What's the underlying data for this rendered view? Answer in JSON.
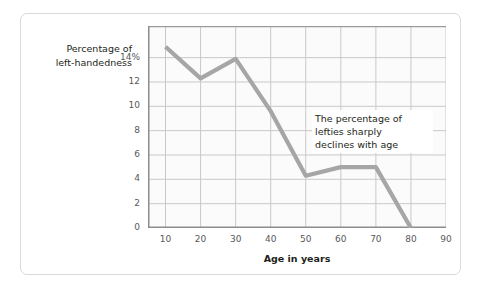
{
  "chart_data": {
    "type": "line",
    "title": "",
    "subtitle": "",
    "xlabel": "Age in years",
    "ylabel": "Percentage of\nleft-handedness",
    "x": [
      10,
      20,
      30,
      40,
      50,
      60,
      70,
      80
    ],
    "values": [
      14.9,
      12.3,
      13.9,
      9.6,
      4.3,
      5.0,
      5.0,
      0.0
    ],
    "series": [
      {
        "name": "Percentage of left-handedness",
        "values": [
          14.9,
          12.3,
          13.9,
          9.6,
          4.3,
          5.0,
          5.0,
          0.0
        ]
      }
    ],
    "xlim": [
      5,
      90
    ],
    "ylim": [
      0,
      16.6
    ],
    "x_ticks": [
      10,
      20,
      30,
      40,
      50,
      60,
      70,
      80,
      90
    ],
    "x_tick_labels": [
      "10",
      "20",
      "30",
      "40",
      "50",
      "60",
      "70",
      "80",
      "90"
    ],
    "y_ticks": [
      0,
      2,
      4,
      6,
      8,
      10,
      12,
      14
    ],
    "y_tick_labels": [
      "0",
      "2",
      "4",
      "6",
      "8",
      "10",
      "12",
      "14%"
    ],
    "grid": true,
    "legend": false,
    "legend_position": "none",
    "line_color": "#a6a6a6",
    "grid_color": "#c9c9c9",
    "plot_background": "#fbfbfb",
    "annotations": [
      {
        "text": "The percentage of\nlefties sharply\ndeclines with age"
      }
    ]
  },
  "colors": {
    "line": "#a6a6a6",
    "grid": "#c9c9c9",
    "axis": "#8c8c8c",
    "card_border": "#d9d9d9",
    "text": "#231f20",
    "tick_text": "#58595b"
  }
}
